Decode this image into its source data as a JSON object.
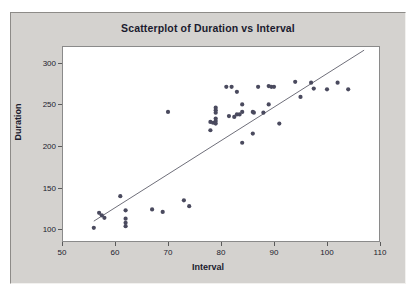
{
  "figure": {
    "background_color": "#ffffff",
    "panel_color": "#d4d2cf",
    "plot_background": "#ffffff",
    "frame_color": "#8a8a8a"
  },
  "chart_data": {
    "type": "scatter",
    "title": "Scatterplot of Duration vs Interval",
    "xlabel": "Interval",
    "ylabel": "Duration",
    "xlim": [
      50,
      110
    ],
    "ylim": [
      85,
      320
    ],
    "xticks": [
      50,
      60,
      70,
      80,
      90,
      100,
      110
    ],
    "yticks": [
      100,
      150,
      200,
      250,
      300
    ],
    "grid": false,
    "legend": false,
    "marker_color": "#4a4a5e",
    "marker_size_px": 4,
    "line": {
      "name": "regression-line",
      "color": "#6f6f7a",
      "width_px": 1,
      "x_start": 56.0,
      "y_start": 110.0,
      "x_end": 107.0,
      "y_end": 315.0
    },
    "points": [
      {
        "x": 56.0,
        "y": 102.0
      },
      {
        "x": 57.0,
        "y": 120.0
      },
      {
        "x": 57.5,
        "y": 117.0
      },
      {
        "x": 58.0,
        "y": 114.0
      },
      {
        "x": 61.0,
        "y": 140.0
      },
      {
        "x": 62.0,
        "y": 123.0
      },
      {
        "x": 62.0,
        "y": 113.0
      },
      {
        "x": 62.0,
        "y": 108.0
      },
      {
        "x": 62.0,
        "y": 104.0
      },
      {
        "x": 67.0,
        "y": 124.0
      },
      {
        "x": 69.0,
        "y": 121.0
      },
      {
        "x": 70.0,
        "y": 241.0
      },
      {
        "x": 73.0,
        "y": 135.0
      },
      {
        "x": 74.0,
        "y": 128.0
      },
      {
        "x": 78.0,
        "y": 219.0
      },
      {
        "x": 78.0,
        "y": 229.0
      },
      {
        "x": 78.5,
        "y": 228.0
      },
      {
        "x": 79.0,
        "y": 246.0
      },
      {
        "x": 79.0,
        "y": 243.0
      },
      {
        "x": 79.0,
        "y": 240.0
      },
      {
        "x": 79.0,
        "y": 233.0
      },
      {
        "x": 79.0,
        "y": 230.0
      },
      {
        "x": 79.0,
        "y": 227.0
      },
      {
        "x": 81.0,
        "y": 271.0
      },
      {
        "x": 82.0,
        "y": 271.0
      },
      {
        "x": 81.5,
        "y": 236.0
      },
      {
        "x": 82.5,
        "y": 235.0
      },
      {
        "x": 83.0,
        "y": 265.0
      },
      {
        "x": 83.0,
        "y": 238.0
      },
      {
        "x": 83.5,
        "y": 238.0
      },
      {
        "x": 84.0,
        "y": 250.0
      },
      {
        "x": 84.0,
        "y": 241.0
      },
      {
        "x": 84.0,
        "y": 204.0
      },
      {
        "x": 86.0,
        "y": 241.0
      },
      {
        "x": 86.2,
        "y": 240.0
      },
      {
        "x": 86.0,
        "y": 215.0
      },
      {
        "x": 87.0,
        "y": 271.0
      },
      {
        "x": 88.0,
        "y": 240.0
      },
      {
        "x": 89.0,
        "y": 272.0
      },
      {
        "x": 89.5,
        "y": 271.0
      },
      {
        "x": 90.0,
        "y": 271.0
      },
      {
        "x": 89.0,
        "y": 250.0
      },
      {
        "x": 91.0,
        "y": 227.0
      },
      {
        "x": 94.0,
        "y": 277.0
      },
      {
        "x": 95.0,
        "y": 259.0
      },
      {
        "x": 97.0,
        "y": 276.0
      },
      {
        "x": 97.5,
        "y": 269.0
      },
      {
        "x": 100.0,
        "y": 268.0
      },
      {
        "x": 102.0,
        "y": 276.0
      },
      {
        "x": 104.0,
        "y": 268.0
      }
    ]
  }
}
